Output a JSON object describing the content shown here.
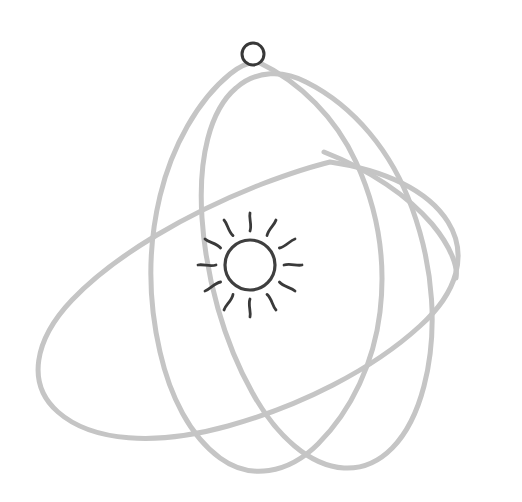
{
  "canvas": {
    "width": 522,
    "height": 502,
    "background": "#ffffff"
  },
  "illustration": {
    "name": "atom-orbit-sketch",
    "style": "hand-drawn line art",
    "description": "Sketch of a sun-like nucleus encircled by three overlapping elliptical orbits with a single small particle on the upper orbit"
  },
  "colors": {
    "orbit_stroke": "#c5c5c5",
    "nucleus_stroke": "#3f3f3f",
    "ray_stroke": "#3a3a3a",
    "particle_stroke": "#383838",
    "particle_fill": "#ffffff",
    "background": "#ffffff"
  },
  "nucleus": {
    "label": "sun",
    "center_x": 250,
    "center_y": 265,
    "radius": 25,
    "stroke_width": 3.2,
    "ray_count": 12,
    "ray_inner_radius": 34,
    "ray_outer_radius": 52,
    "ray_stroke_width": 2.8
  },
  "particle": {
    "label": "electron",
    "center_x": 253,
    "center_y": 54,
    "radius": 11,
    "stroke_width": 3
  },
  "orbits": [
    {
      "id": "orbit-1",
      "label": "steep left-leaning orbit",
      "center_x": 255,
      "center_y": 262,
      "radius_x": 112,
      "radius_y": 208,
      "rotation_deg": 18,
      "stroke_width": 5
    },
    {
      "id": "orbit-2",
      "label": "wide shallow orbit",
      "center_x": 250,
      "center_y": 272,
      "radius_x": 212,
      "radius_y": 108,
      "rotation_deg": -28,
      "stroke_width": 5
    },
    {
      "id": "orbit-3",
      "label": "tilted open orbit with trailing tail",
      "center_x": 258,
      "center_y": 258,
      "radius_x": 120,
      "radius_y": 200,
      "rotation_deg": -22,
      "stroke_width": 5
    }
  ]
}
